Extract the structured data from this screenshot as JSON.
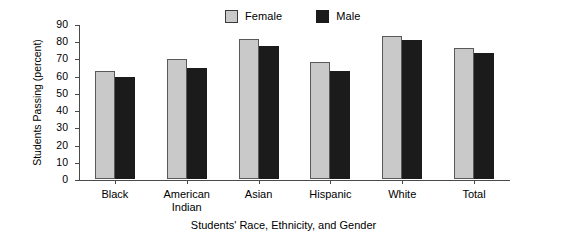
{
  "chart_data": {
    "type": "bar",
    "title": "",
    "xlabel": "Students' Race, Ethnicity, and Gender",
    "ylabel": "Students Passing (percent)",
    "ylim": [
      0,
      90
    ],
    "yticks": [
      0,
      10,
      20,
      30,
      40,
      50,
      60,
      70,
      80,
      90
    ],
    "grid": false,
    "legend_position": "top-center",
    "categories": [
      "Black",
      "American Indian",
      "Asian",
      "Hispanic",
      "White",
      "Total"
    ],
    "category_lines": [
      [
        "Black"
      ],
      [
        "American",
        "Indian"
      ],
      [
        "Asian"
      ],
      [
        "Hispanic"
      ],
      [
        "White"
      ],
      [
        "Total"
      ]
    ],
    "series": [
      {
        "name": "Female",
        "color": "#c9c9c9",
        "values": [
          63,
          69.5,
          81.5,
          68,
          83,
          76
        ]
      },
      {
        "name": "Male",
        "color": "#1b1b1b",
        "values": [
          59.5,
          64.5,
          77.5,
          63,
          80.5,
          73
        ]
      }
    ]
  }
}
